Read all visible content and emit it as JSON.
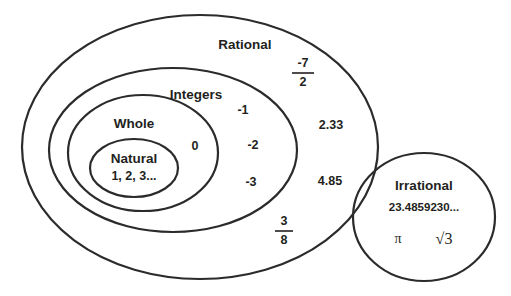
{
  "diagram": {
    "type": "nested-venn",
    "stroke_color": "#2b2b2b",
    "text_color": "#231f20",
    "background_color": "#ffffff",
    "sets": [
      {
        "id": "rational",
        "label": "Rational",
        "shape": "ellipse",
        "cx": 200,
        "cy": 147,
        "rx": 178,
        "ry": 132,
        "label_x": 245,
        "label_y": 45
      },
      {
        "id": "integers",
        "label": "Integers",
        "shape": "ellipse",
        "cx": 173,
        "cy": 150,
        "rx": 124,
        "ry": 82,
        "label_x": 196,
        "label_y": 95
      },
      {
        "id": "whole",
        "label": "Whole",
        "shape": "ellipse",
        "cx": 143,
        "cy": 153,
        "rx": 75,
        "ry": 58,
        "label_x": 134,
        "label_y": 124
      },
      {
        "id": "natural",
        "label": "Natural",
        "shape": "ellipse",
        "cx": 134,
        "cy": 168,
        "rx": 44,
        "ry": 29,
        "label_x": 134,
        "label_y": 159
      },
      {
        "id": "irrational",
        "label": "Irrational",
        "shape": "circle",
        "cx": 424,
        "cy": 217,
        "rx": 71,
        "ry": 64,
        "label_x": 424,
        "label_y": 186
      }
    ],
    "members": {
      "natural": [
        {
          "text": "1, 2, 3...",
          "x": 134,
          "y": 177
        }
      ],
      "whole": [
        {
          "text": "0",
          "x": 195,
          "y": 147
        }
      ],
      "integers": [
        {
          "text": "-1",
          "x": 243,
          "y": 111
        },
        {
          "text": "-2",
          "x": 253,
          "y": 146
        },
        {
          "text": "-3",
          "x": 251,
          "y": 183
        }
      ],
      "rational": [
        {
          "text": "2.33",
          "x": 331,
          "y": 126
        },
        {
          "text": "4.85",
          "x": 330,
          "y": 182
        }
      ],
      "irrational": [
        {
          "text": "23.4859230...",
          "x": 424,
          "y": 208
        }
      ]
    },
    "fractions": [
      {
        "id": "negative-seven-halves",
        "numerator": "-7",
        "denominator": "2",
        "x": 303,
        "y": 72,
        "width": 22
      },
      {
        "id": "three-eighths",
        "numerator": "3",
        "denominator": "8",
        "x": 284,
        "y": 230,
        "width": 18
      }
    ],
    "symbols": [
      {
        "id": "pi-symbol",
        "text": "π",
        "x": 398,
        "y": 240
      },
      {
        "id": "sqrt-three-symbol",
        "text": "√3",
        "x": 444,
        "y": 240
      }
    ]
  }
}
